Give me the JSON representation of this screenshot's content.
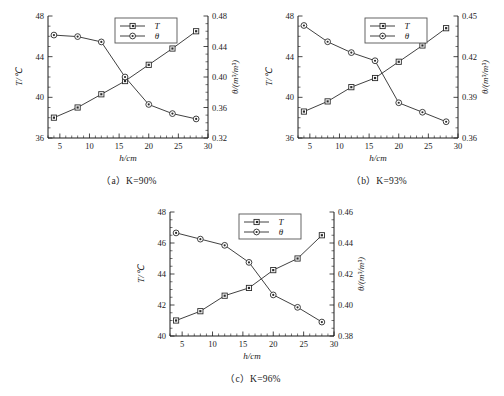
{
  "figure": {
    "panels": [
      "a",
      "b",
      "c"
    ],
    "legend": {
      "t_label": "T",
      "theta_label": "θ"
    },
    "captions": {
      "a": "（a）K=90%",
      "b": "（b）K=93%",
      "c": "（c）K=96%"
    },
    "axis_titles": {
      "x": "h/cm",
      "y_left": "T/℃",
      "y_right": "θ/(m³/m³)"
    }
  },
  "chart_data": [
    {
      "type": "line",
      "panel": "a",
      "title": "（a）K=90%",
      "xlabel": "h/cm",
      "ylabel": "T/℃",
      "ylabel_right": "θ/(m³/m³)",
      "x": [
        4,
        8,
        12,
        16,
        20,
        24,
        28
      ],
      "xlim": [
        3,
        30
      ],
      "xticks": [
        5,
        10,
        15,
        20,
        25,
        30
      ],
      "ylim": [
        36,
        48
      ],
      "yticks": [
        36,
        40,
        44,
        48
      ],
      "ylim_right": [
        0.32,
        0.48
      ],
      "yticks_right": [
        0.32,
        0.36,
        0.4,
        0.44,
        0.48
      ],
      "grid": false,
      "legend_position": "top-center",
      "series": [
        {
          "name": "T",
          "axis": "left",
          "marker": "square",
          "values": [
            38.0,
            39.0,
            40.3,
            41.6,
            43.2,
            44.8,
            46.5
          ]
        },
        {
          "name": "θ",
          "axis": "right",
          "marker": "circle",
          "values": [
            0.455,
            0.453,
            0.446,
            0.4,
            0.364,
            0.352,
            0.345
          ]
        }
      ]
    },
    {
      "type": "line",
      "panel": "b",
      "title": "（b）K=93%",
      "xlabel": "h/cm",
      "ylabel": "T/℃",
      "ylabel_right": "θ/(m³/m³)",
      "x": [
        4,
        8,
        12,
        16,
        20,
        24,
        28
      ],
      "xlim": [
        3,
        30
      ],
      "xticks": [
        5,
        10,
        15,
        20,
        25,
        30
      ],
      "ylim": [
        36,
        48
      ],
      "yticks": [
        36,
        40,
        44,
        48
      ],
      "ylim_right": [
        0.36,
        0.45
      ],
      "yticks_right": [
        0.36,
        0.39,
        0.42,
        0.45
      ],
      "grid": false,
      "legend_position": "top-center",
      "series": [
        {
          "name": "T",
          "axis": "left",
          "marker": "square",
          "values": [
            38.6,
            39.6,
            41.0,
            41.9,
            43.5,
            45.1,
            46.8
          ]
        },
        {
          "name": "θ",
          "axis": "right",
          "marker": "circle",
          "values": [
            0.443,
            0.431,
            0.423,
            0.417,
            0.386,
            0.379,
            0.372
          ]
        }
      ]
    },
    {
      "type": "line",
      "panel": "c",
      "title": "（c）K=96%",
      "xlabel": "h/cm",
      "ylabel": "T/℃",
      "ylabel_right": "θ/(m³/m³)",
      "x": [
        4,
        8,
        12,
        16,
        20,
        24,
        28
      ],
      "xlim": [
        3,
        30
      ],
      "xticks": [
        5,
        10,
        15,
        20,
        25,
        30
      ],
      "ylim": [
        40,
        48
      ],
      "yticks": [
        40,
        42,
        44,
        46,
        48
      ],
      "ylim_right": [
        0.38,
        0.46
      ],
      "yticks_right": [
        0.38,
        0.4,
        0.42,
        0.44,
        0.46
      ],
      "grid": false,
      "legend_position": "top-center",
      "series": [
        {
          "name": "T",
          "axis": "left",
          "marker": "square",
          "values": [
            41.0,
            41.6,
            42.6,
            43.1,
            44.25,
            45.0,
            46.5
          ]
        },
        {
          "name": "θ",
          "axis": "right",
          "marker": "circle",
          "values": [
            0.4465,
            0.4425,
            0.4385,
            0.4275,
            0.4065,
            0.3985,
            0.389
          ]
        }
      ]
    }
  ]
}
